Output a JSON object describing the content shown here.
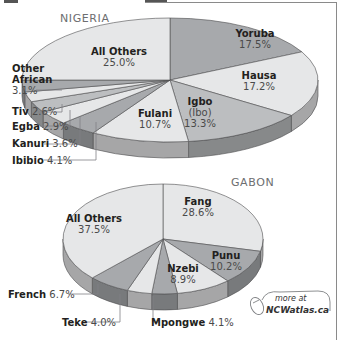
{
  "chart_data": [
    {
      "type": "pie",
      "title": "NIGERIA",
      "style": "3d",
      "slices": [
        {
          "label": "Yoruba",
          "value": 17.5,
          "color": "#a7a9ac"
        },
        {
          "label": "Hausa",
          "value": 17.2,
          "color": "#e6e7e8"
        },
        {
          "label": "Igbo (Ibo)",
          "value": 13.3,
          "color": "#bcbec0"
        },
        {
          "label": "Fulani",
          "value": 10.7,
          "color": "#e6e7e8"
        },
        {
          "label": "Ibibio",
          "value": 4.1,
          "color": "#a7a9ac"
        },
        {
          "label": "Kanuri",
          "value": 3.6,
          "color": "#e6e7e8"
        },
        {
          "label": "Egba",
          "value": 2.9,
          "color": "#bcbec0"
        },
        {
          "label": "Tiv",
          "value": 2.6,
          "color": "#e6e7e8"
        },
        {
          "label": "Other African",
          "value": 3.1,
          "color": "#a7a9ac"
        },
        {
          "label": "All Others",
          "value": 25.0,
          "color": "#e6e7e8"
        }
      ]
    },
    {
      "type": "pie",
      "title": "GABON",
      "style": "3d",
      "slices": [
        {
          "label": "Fang",
          "value": 28.6,
          "color": "#e6e7e8"
        },
        {
          "label": "Punu",
          "value": 10.2,
          "color": "#a7a9ac"
        },
        {
          "label": "Nzebi",
          "value": 8.9,
          "color": "#e6e7e8"
        },
        {
          "label": "Mpongwe",
          "value": 4.1,
          "color": "#a7a9ac"
        },
        {
          "label": "Teke",
          "value": 4.0,
          "color": "#e6e7e8"
        },
        {
          "label": "French",
          "value": 6.7,
          "color": "#a7a9ac"
        },
        {
          "label": "All Others",
          "value": 37.5,
          "color": "#e6e7e8"
        }
      ]
    }
  ],
  "nigeria": {
    "title": "NIGERIA",
    "labels": {
      "yoruba": {
        "name": "Yoruba",
        "pct": "17.5%"
      },
      "hausa": {
        "name": "Hausa",
        "pct": "17.2%"
      },
      "igbo": {
        "name": "Igbo",
        "alt": "(Ibo)",
        "pct": "13.3%"
      },
      "fulani": {
        "name": "Fulani",
        "pct": "10.7%"
      },
      "all_others": {
        "name": "All Others",
        "pct": "25.0%"
      },
      "other_african": {
        "name1": "Other",
        "name2": "African",
        "pct": "3.1%"
      },
      "tiv": {
        "name": "Tiv",
        "pct": "2.6%"
      },
      "egba": {
        "name": "Egba",
        "pct": "2.9%"
      },
      "kanuri": {
        "name": "Kanuri",
        "pct": "3.6%"
      },
      "ibibio": {
        "name": "Ibibio",
        "pct": "4.1%"
      }
    }
  },
  "gabon": {
    "title": "GABON",
    "labels": {
      "fang": {
        "name": "Fang",
        "pct": "28.6%"
      },
      "punu": {
        "name": "Punu",
        "pct": "10.2%"
      },
      "nzebi": {
        "name": "Nzebi",
        "pct": "8.9%"
      },
      "all_others": {
        "name": "All Others",
        "pct": "37.5%"
      },
      "french": {
        "name": "French",
        "pct": "6.7%"
      },
      "teke": {
        "name": "Teke",
        "pct": "4.0%"
      },
      "mpongwe": {
        "name": "Mpongwe",
        "pct": "4.1%"
      }
    }
  },
  "badge": {
    "line1": "more at",
    "line2": "NCWatlas.ca",
    "icon": "computer-mouse-icon"
  }
}
